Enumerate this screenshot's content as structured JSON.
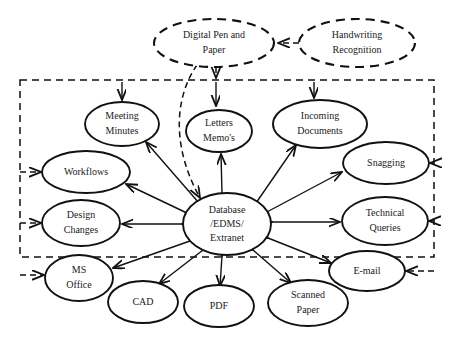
{
  "diagram": {
    "canvas": {
      "width": 454,
      "height": 348,
      "background": "#ffffff"
    },
    "colors": {
      "stroke": "#111111",
      "text": "#1a1a1a",
      "background": "#ffffff"
    },
    "boundary": {
      "name": "system-boundary",
      "style": "dashed",
      "x": 20,
      "y": 80,
      "width": 414,
      "height": 177
    },
    "external_nodes": [
      {
        "id": "digital-pen-and-paper",
        "label_lines": [
          "Digital Pen and",
          "Paper"
        ],
        "cx": 214,
        "cy": 43,
        "rx": 60,
        "ry": 24,
        "style": "dashed"
      },
      {
        "id": "handwriting-recognition",
        "label_lines": [
          "Handwriting",
          "Recognition"
        ],
        "cx": 357,
        "cy": 43,
        "rx": 58,
        "ry": 24,
        "style": "dashed"
      }
    ],
    "internal_nodes": [
      {
        "id": "meeting-minutes",
        "label_lines": [
          "Meeting",
          "Minutes"
        ],
        "cx": 122,
        "cy": 124,
        "rx": 37,
        "ry": 22,
        "style": "solid"
      },
      {
        "id": "letters-memos",
        "label_lines": [
          "Letters",
          "Memo's"
        ],
        "cx": 219,
        "cy": 131,
        "rx": 33,
        "ry": 21,
        "style": "solid"
      },
      {
        "id": "incoming-documents",
        "label_lines": [
          "Incoming",
          "Documents"
        ],
        "cx": 320,
        "cy": 124,
        "rx": 47,
        "ry": 24,
        "style": "solid"
      },
      {
        "id": "snagging",
        "label_lines": [
          "Snagging"
        ],
        "cx": 386,
        "cy": 163,
        "rx": 43,
        "ry": 21,
        "style": "solid"
      },
      {
        "id": "workflows",
        "label_lines": [
          "Workflows"
        ],
        "cx": 86,
        "cy": 172,
        "rx": 44,
        "ry": 21,
        "style": "solid"
      },
      {
        "id": "design-changes",
        "label_lines": [
          "Design",
          "Changes"
        ],
        "cx": 81,
        "cy": 223,
        "rx": 39,
        "ry": 23,
        "style": "solid"
      },
      {
        "id": "technical-queries",
        "label_lines": [
          "Technical",
          "Queries"
        ],
        "cx": 385,
        "cy": 221,
        "rx": 43,
        "ry": 24,
        "style": "solid"
      },
      {
        "id": "ms-office",
        "label_lines": [
          "MS",
          "Office"
        ],
        "cx": 79,
        "cy": 278,
        "rx": 34,
        "ry": 23,
        "style": "solid"
      },
      {
        "id": "email",
        "label_lines": [
          "E-mail"
        ],
        "cx": 367,
        "cy": 271,
        "rx": 38,
        "ry": 20,
        "style": "solid"
      },
      {
        "id": "cad",
        "label_lines": [
          "CAD"
        ],
        "cx": 143,
        "cy": 302,
        "rx": 35,
        "ry": 21,
        "style": "solid"
      },
      {
        "id": "pdf",
        "label_lines": [
          "PDF"
        ],
        "cx": 219,
        "cy": 306,
        "rx": 35,
        "ry": 21,
        "style": "solid"
      },
      {
        "id": "scanned-paper",
        "label_lines": [
          "Scanned",
          "Paper"
        ],
        "cx": 308,
        "cy": 303,
        "rx": 40,
        "ry": 23,
        "style": "solid"
      },
      {
        "id": "database-edms-extranet",
        "label_lines": [
          "Database",
          "/EDMS/",
          "Extranet"
        ],
        "cx": 227,
        "cy": 224,
        "rx": 44,
        "ry": 31,
        "style": "solid",
        "role": "hub"
      }
    ],
    "edges": [
      {
        "id": "pen-to-handwriting",
        "from": "handwriting-recognition",
        "to": "digital-pen-and-paper",
        "style": "dashed",
        "arrow": "single"
      },
      {
        "id": "pen-to-database",
        "from": "digital-pen-and-paper",
        "to": "database-edms-extranet",
        "style": "dashed",
        "arrow": "single"
      },
      {
        "id": "pen-to-letters",
        "from": "digital-pen-and-paper",
        "to": "letters-memos",
        "style": "dashed",
        "arrow": "single"
      },
      {
        "id": "boundary-to-meeting-minutes",
        "from": "boundary-top",
        "to": "meeting-minutes",
        "style": "solid",
        "arrow": "single"
      },
      {
        "id": "boundary-to-letters-memos",
        "from": "boundary-top",
        "to": "letters-memos",
        "style": "solid",
        "arrow": "single"
      },
      {
        "id": "boundary-to-incoming-documents",
        "from": "boundary-top",
        "to": "incoming-documents",
        "style": "solid",
        "arrow": "single"
      },
      {
        "id": "boundary-to-workflows",
        "from": "boundary-left",
        "to": "workflows",
        "style": "dashed",
        "arrow": "single"
      },
      {
        "id": "boundary-to-design-changes",
        "from": "boundary-left",
        "to": "design-changes",
        "style": "dashed",
        "arrow": "single"
      },
      {
        "id": "boundary-to-ms-office",
        "from": "boundary-left",
        "to": "ms-office",
        "style": "dashed",
        "arrow": "single"
      },
      {
        "id": "boundary-to-snagging",
        "from": "boundary-right",
        "to": "snagging",
        "style": "dashed",
        "arrow": "single"
      },
      {
        "id": "boundary-to-technical-queries",
        "from": "boundary-right",
        "to": "technical-queries",
        "style": "dashed",
        "arrow": "single"
      },
      {
        "id": "boundary-to-email",
        "from": "boundary-right",
        "to": "email",
        "style": "dashed",
        "arrow": "single"
      },
      {
        "id": "database-meeting-minutes",
        "from": "database-edms-extranet",
        "to": "meeting-minutes",
        "style": "solid",
        "arrow": "double"
      },
      {
        "id": "database-letters-memos",
        "from": "database-edms-extranet",
        "to": "letters-memos",
        "style": "solid",
        "arrow": "double"
      },
      {
        "id": "database-incoming-documents",
        "from": "database-edms-extranet",
        "to": "incoming-documents",
        "style": "solid",
        "arrow": "double"
      },
      {
        "id": "database-snagging",
        "from": "database-edms-extranet",
        "to": "snagging",
        "style": "solid",
        "arrow": "double"
      },
      {
        "id": "database-workflows",
        "from": "database-edms-extranet",
        "to": "workflows",
        "style": "solid",
        "arrow": "double"
      },
      {
        "id": "database-design-changes",
        "from": "database-edms-extranet",
        "to": "design-changes",
        "style": "solid",
        "arrow": "double"
      },
      {
        "id": "database-technical-queries",
        "from": "database-edms-extranet",
        "to": "technical-queries",
        "style": "solid",
        "arrow": "double"
      },
      {
        "id": "database-ms-office",
        "from": "database-edms-extranet",
        "to": "ms-office",
        "style": "solid",
        "arrow": "double"
      },
      {
        "id": "database-email",
        "from": "database-edms-extranet",
        "to": "email",
        "style": "solid",
        "arrow": "double"
      },
      {
        "id": "database-cad",
        "from": "database-edms-extranet",
        "to": "cad",
        "style": "solid",
        "arrow": "double"
      },
      {
        "id": "database-pdf",
        "from": "database-edms-extranet",
        "to": "pdf",
        "style": "solid",
        "arrow": "double"
      },
      {
        "id": "database-scanned-paper",
        "from": "database-edms-extranet",
        "to": "scanned-paper",
        "style": "solid",
        "arrow": "double"
      }
    ]
  }
}
